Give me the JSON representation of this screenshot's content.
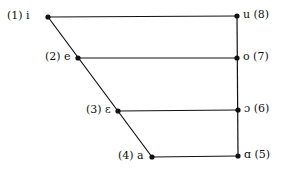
{
  "diagram": {
    "vowels": [
      {
        "num": "(1)",
        "symbol": "i",
        "label": "(1) i",
        "x": 48,
        "y": 17
      },
      {
        "num": "(2)",
        "symbol": "e",
        "label": "(2) e",
        "x": 78,
        "y": 58
      },
      {
        "num": "(3)",
        "symbol": "ɛ",
        "label": "(3) ɛ",
        "x": 118,
        "y": 111
      },
      {
        "num": "(4)",
        "symbol": "a",
        "label": "(4) a",
        "x": 152,
        "y": 157
      },
      {
        "num": "(5)",
        "symbol": "ɑ",
        "label": "ɑ (5)",
        "x": 238,
        "y": 156
      },
      {
        "num": "(6)",
        "symbol": "ɔ",
        "label": "ɔ (6)",
        "x": 238,
        "y": 110
      },
      {
        "num": "(7)",
        "symbol": "o",
        "label": "o (7)",
        "x": 237,
        "y": 58
      },
      {
        "num": "(8)",
        "symbol": "u",
        "label": "u (8)",
        "x": 237,
        "y": 16
      }
    ],
    "line_color": "#111111"
  }
}
